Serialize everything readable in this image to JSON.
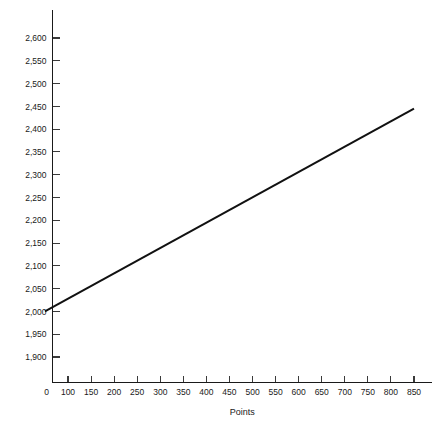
{
  "chart_data": {
    "type": "line",
    "title": "",
    "subtitle": "",
    "xlabel": "Points",
    "ylabel": "",
    "grid": false,
    "legend": false,
    "xlim": [
      0,
      880
    ],
    "ylim": [
      1875,
      2625
    ],
    "x_ticks": [
      0,
      100,
      150,
      200,
      250,
      300,
      350,
      400,
      450,
      500,
      550,
      600,
      650,
      700,
      750,
      800,
      850
    ],
    "x_tick_labels": [
      "0",
      "100",
      "150",
      "200",
      "250",
      "300",
      "350",
      "400",
      "450",
      "500",
      "550",
      "600",
      "650",
      "700",
      "750",
      "800",
      "850"
    ],
    "y_ticks": [
      1900,
      1950,
      2000,
      2050,
      2100,
      2150,
      2200,
      2250,
      2300,
      2350,
      2400,
      2450,
      2500,
      2550,
      2600
    ],
    "y_tick_labels": [
      "1,900",
      "1,950",
      "2,000",
      "2,050",
      "2,100",
      "2,150",
      "2,200",
      "2,250",
      "2,300",
      "2,350",
      "2,400",
      "2,450",
      "2,500",
      "2,550",
      "2,600"
    ],
    "series": [
      {
        "name": "payout",
        "color": "#111111",
        "x": [
          50,
          850
        ],
        "values": [
          2000,
          2445
        ]
      }
    ],
    "annotations": []
  }
}
